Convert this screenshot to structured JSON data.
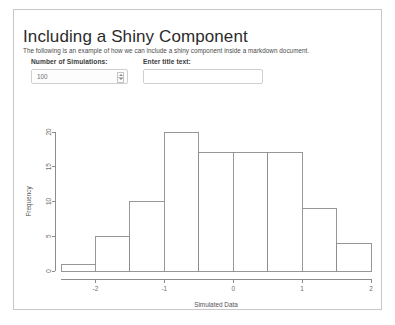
{
  "document": {
    "title": "Including a Shiny Component",
    "subtitle": "The following is an example of how we can include a shiny component inside a markdown document."
  },
  "controls": {
    "simulations": {
      "label": "Number of Simulations:",
      "value": "100",
      "spinner_up_icon": "caret-up-icon",
      "spinner_down_icon": "caret-down-icon"
    },
    "title_text": {
      "label": "Enter title text:",
      "value": "",
      "placeholder": ""
    }
  },
  "chart_data": {
    "type": "bar",
    "title": "",
    "xlabel": "Simulated Data",
    "ylabel": "Frequency",
    "bin_edges": [
      -2.5,
      -2.0,
      -1.5,
      -1.0,
      -0.5,
      0.0,
      0.5,
      1.0,
      1.5,
      2.0
    ],
    "categories": [
      "-2.5 to -2.0",
      "-2.0 to -1.5",
      "-1.5 to -1.0",
      "-1.0 to -0.5",
      "-0.5 to 0.0",
      "0.0 to 0.5",
      "0.5 to 1.0",
      "1.0 to 1.5",
      "1.5 to 2.0"
    ],
    "values": [
      1,
      5,
      10,
      20,
      17,
      17,
      17,
      9,
      4
    ],
    "xticks": [
      "-2",
      "-1",
      "0",
      "1",
      "2"
    ],
    "xtick_values": [
      -2,
      -1,
      0,
      1,
      2
    ],
    "yticks": [
      "0",
      "5",
      "10",
      "15",
      "20"
    ],
    "ytick_values": [
      0,
      5,
      10,
      15,
      20
    ],
    "xlim": [
      -2.5,
      2.0
    ],
    "ylim": [
      0,
      20
    ],
    "grid": false,
    "legend": false
  },
  "colors": {
    "panel_border": "#c8c8c8",
    "axis": "#8c8c8c",
    "bar_fill": "#ffffff",
    "bar_stroke": "#8c8c8c",
    "text": "#333333"
  }
}
